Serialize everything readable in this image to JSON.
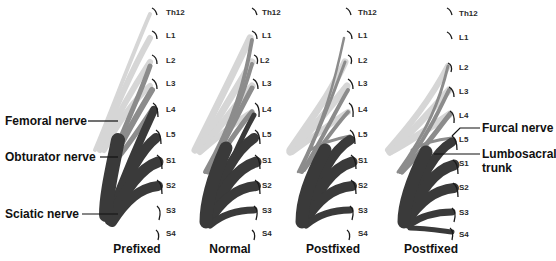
{
  "figure": {
    "type": "anatomical-diagram",
    "colors": {
      "femoral": "#d4d4d4",
      "obturator": "#8a8a8a",
      "sciatic": "#3a3a3a",
      "root_cap": "#1a1a1a",
      "text": "#111111"
    },
    "vertebra_labels": [
      "Th12",
      "L1",
      "L2",
      "L3",
      "L4",
      "L5",
      "S1",
      "S2",
      "S3",
      "S4"
    ],
    "panels": [
      {
        "caption": "Prefixed",
        "labels": [
          "Th12",
          "L1",
          "L2",
          "L3",
          "L4",
          "L5",
          "S1",
          "S2",
          "S3",
          "S4"
        ]
      },
      {
        "caption": "Normal",
        "labels": [
          "Th12",
          "L1",
          "L2",
          "L3",
          "L4",
          "L5",
          "S1",
          "S2",
          "S3",
          "S4"
        ]
      },
      {
        "caption": "Postfixed",
        "labels": [
          "Th12",
          "L1",
          "L2",
          "L3",
          "L4",
          "L5",
          "S1",
          "S2",
          "S3",
          "S4"
        ]
      },
      {
        "caption": "Postfixed",
        "labels": [
          "Th12",
          "L1",
          "L2",
          "L3",
          "L4",
          "L5",
          "S1",
          "S2",
          "S3",
          "S4"
        ]
      }
    ],
    "callouts_left": {
      "femoral": "Femoral nerve",
      "obturator": "Obturator nerve",
      "sciatic": "Sciatic nerve"
    },
    "callouts_right": {
      "furcal": "Furcal nerve",
      "lumbosacral_line1": "Lumbosacral",
      "lumbosacral_line2": "trunk"
    }
  }
}
